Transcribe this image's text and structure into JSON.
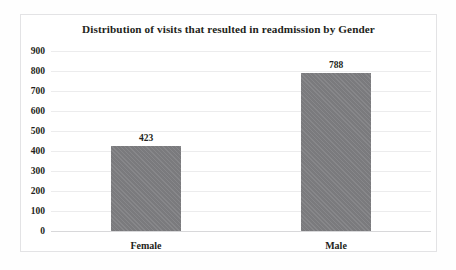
{
  "chart_data": {
    "type": "bar",
    "title": "Distribution of visits that resulted in readmission by Gender",
    "categories": [
      "Female",
      "Male"
    ],
    "values": [
      423,
      788
    ],
    "data_labels": [
      "423",
      "788"
    ],
    "xlabel": "",
    "ylabel": "",
    "ylim": [
      0,
      900
    ],
    "ytick_step": 100,
    "ytick_labels": [
      "900",
      "800",
      "700",
      "600",
      "500",
      "400",
      "300",
      "200",
      "100",
      "0"
    ],
    "ytick_values": [
      900,
      800,
      700,
      600,
      500,
      400,
      300,
      200,
      100,
      0
    ],
    "grid": true,
    "grid_axis": "y",
    "legend": false,
    "legend_position": "none",
    "series": [
      {
        "name": "Visits resulting in readmission",
        "values": [
          423,
          788
        ],
        "color": "#808083"
      }
    ],
    "colors": {
      "bar": "#808083",
      "gridline": "#ececed",
      "baseline": "#d8d8da",
      "frame_border": "#e3e3e5",
      "text": "#231f20",
      "plot_background": "#ffffff"
    }
  }
}
